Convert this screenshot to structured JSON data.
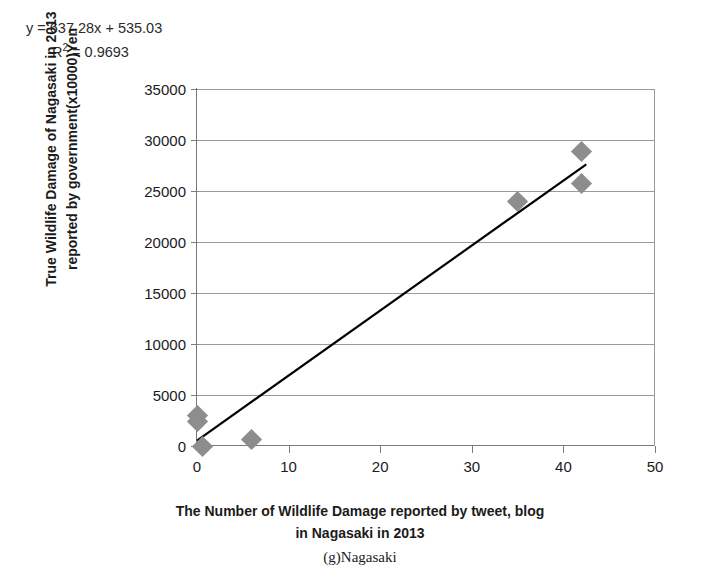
{
  "annotations": {
    "equation": "y = 637.28x + 535.03",
    "r_squared_prefix": "R",
    "r_squared_exponent": "2",
    "r_squared_value": "= 0.9693"
  },
  "axes": {
    "ylabel_line1": "True Wildlife Damage of Nagasaki in 2013",
    "ylabel_line2": "reported by government(x10000)Yen",
    "xlabel_line1": "The Number of Wildlife Damage reported by tweet, blog",
    "xlabel_line2": "in Nagasaki in 2013"
  },
  "caption": "(g)Nagasaki",
  "colors": {
    "marker": "#8d8d8d",
    "trendline": "#000000",
    "gridline": "#9b9b9b",
    "axis": "#7a7a7a",
    "text": "#1b1b1b",
    "background": "#ffffff"
  },
  "chart_data": {
    "type": "scatter",
    "title": "",
    "subtitle": "",
    "xlabel": "The Number of Wildlife Damage reported by tweet, blog in Nagasaki in 2013",
    "ylabel": "True Wildlife Damage of Nagasaki in 2013 reported by government(x10000)Yen",
    "xlim": [
      0,
      50
    ],
    "ylim": [
      0,
      35000
    ],
    "xticks": [
      0,
      10,
      20,
      30,
      40,
      50
    ],
    "yticks": [
      0,
      5000,
      10000,
      15000,
      20000,
      25000,
      30000,
      35000
    ],
    "xtick_labels": [
      "0",
      "10",
      "20",
      "30",
      "40",
      "50"
    ],
    "ytick_labels": [
      "0",
      "5000",
      "10000",
      "15000",
      "20000",
      "25000",
      "30000",
      "35000"
    ],
    "grid": "horizontal",
    "legend": "none",
    "points": [
      {
        "x": 0,
        "y": 3000
      },
      {
        "x": 0,
        "y": 2400
      },
      {
        "x": 0.6,
        "y": 0
      },
      {
        "x": 6,
        "y": 600
      },
      {
        "x": 35,
        "y": 24000
      },
      {
        "x": 42,
        "y": 28900
      },
      {
        "x": 42,
        "y": 25700
      }
    ],
    "trendline": {
      "equation": "y = 637.28x + 535.03",
      "slope": 637.28,
      "intercept": 535.03,
      "r_squared": 0.9693,
      "x_start": 0,
      "x_end": 42.5
    }
  }
}
